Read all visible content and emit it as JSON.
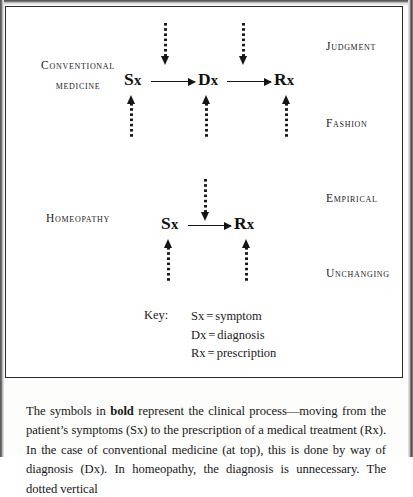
{
  "figure": {
    "rows": [
      {
        "id": "conventional",
        "label_line1": "Conventional",
        "label_line2": "medicine",
        "nodes": [
          {
            "id": "sx",
            "head": "S",
            "sub": "x"
          },
          {
            "id": "dx",
            "head": "D",
            "sub": "x"
          },
          {
            "id": "rx",
            "head": "R",
            "sub": "x"
          }
        ]
      },
      {
        "id": "homeopathy",
        "label_line1": "Homeopathy",
        "label_line2": "",
        "nodes": [
          {
            "id": "sx",
            "head": "S",
            "sub": "x"
          },
          {
            "id": "rx",
            "head": "R",
            "sub": "x"
          }
        ]
      }
    ],
    "right_labels": [
      {
        "id": "judgment",
        "text": "Judgment"
      },
      {
        "id": "fashion",
        "text": "Fashion"
      },
      {
        "id": "empirical",
        "text": "Empirical"
      },
      {
        "id": "unchanging",
        "text": "Unchanging"
      }
    ],
    "key": {
      "title": "Key:",
      "entries": [
        {
          "symbol": "Sx",
          "eq": "=",
          "meaning": "symptom"
        },
        {
          "symbol": "Dx",
          "eq": "=",
          "meaning": "diagnosis"
        },
        {
          "symbol": "Rx",
          "eq": "=",
          "meaning": "prescription"
        }
      ]
    }
  },
  "caption": {
    "part1": "The symbols in ",
    "bold": "bold",
    "part2": " represent the clinical process—moving from the patient’s symptoms (Sx) to the prescription of a medical treatment (Rx). In the case of conventional medicine (at top), this is done by way of diagnosis (Dx). In homeopathy, the diagnosis is unnecessary. The dotted vertical"
  }
}
